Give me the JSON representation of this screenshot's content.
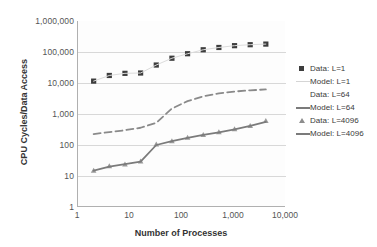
{
  "chart_data": {
    "type": "scatter",
    "title": "",
    "xlabel": "Number of Processes",
    "ylabel": "CPU Cycles/Data Access",
    "xscale": "log",
    "yscale": "log",
    "xlim": [
      1,
      10000
    ],
    "ylim": [
      1,
      1000000
    ],
    "xticks": [
      "1",
      "10",
      "100",
      "1,000",
      "10,000"
    ],
    "xtick_values": [
      1,
      10,
      100,
      1000,
      10000
    ],
    "yticks": [
      "1",
      "10",
      "100",
      "1,000",
      "10,000",
      "100,000",
      "1,000,000"
    ],
    "ytick_values": [
      1,
      10,
      100,
      1000,
      10000,
      100000,
      1000000
    ],
    "grid": true,
    "grid_axis": "y",
    "legend_position": "right",
    "series": [
      {
        "name": "Data: L=1",
        "kind": "markers",
        "marker": "square",
        "color": "#3d3d3d",
        "x": [
          2,
          4,
          8,
          16,
          32,
          64,
          128,
          256,
          512,
          1024,
          2048,
          4096
        ],
        "y": [
          11500,
          17500,
          20500,
          21000,
          38000,
          63000,
          88000,
          118000,
          140000,
          160000,
          172000,
          180000
        ]
      },
      {
        "name": "Model: L=1",
        "kind": "line",
        "style": "solid-faint",
        "color": "#dcdcdc",
        "x": [
          2,
          4,
          8,
          16,
          32,
          64,
          128,
          256,
          512,
          1024,
          2048,
          4096
        ],
        "y": [
          11500,
          17500,
          20500,
          21000,
          38000,
          63000,
          88000,
          118000,
          140000,
          160000,
          172000,
          180000
        ]
      },
      {
        "name": "Data: L=64",
        "kind": "markers",
        "marker": "none",
        "color": "#ffffff",
        "x": [
          2,
          4,
          8,
          16,
          32,
          64,
          128,
          256,
          512,
          1024,
          2048,
          4096
        ],
        "y": [
          225,
          260,
          300,
          360,
          520,
          1500,
          2600,
          3700,
          4600,
          5300,
          5800,
          6200
        ]
      },
      {
        "name": "Model: L=64",
        "kind": "line",
        "style": "dashed",
        "color": "#8a8a8a",
        "x": [
          2,
          4,
          8,
          16,
          32,
          64,
          128,
          256,
          512,
          1024,
          2048,
          4096
        ],
        "y": [
          225,
          260,
          300,
          360,
          520,
          1500,
          2600,
          3700,
          4600,
          5300,
          5800,
          6200
        ]
      },
      {
        "name": "Data: L=4096",
        "kind": "markers",
        "marker": "triangle",
        "color": "#9a9a9a",
        "x": [
          2,
          4,
          8,
          16,
          32,
          64,
          128,
          256,
          512,
          1024,
          2048,
          4096
        ],
        "y": [
          15,
          21,
          24,
          30,
          105,
          135,
          175,
          215,
          260,
          330,
          420,
          600
        ]
      },
      {
        "name": "Model: L=4096",
        "kind": "line",
        "style": "solid",
        "color": "#7b7b7b",
        "x": [
          2,
          4,
          8,
          16,
          32,
          64,
          128,
          256,
          512,
          1024,
          2048,
          4096
        ],
        "y": [
          15,
          20,
          24,
          29,
          100,
          133,
          170,
          212,
          255,
          320,
          415,
          560
        ]
      }
    ]
  },
  "axes": {
    "x_title": "Number of Processes",
    "y_title": "CPU Cycles/Data Access"
  },
  "legend": {
    "items": [
      {
        "label": "Data: L=1",
        "key": "square"
      },
      {
        "label": "Model: L=1",
        "key": "line-faint"
      },
      {
        "label": "Data: L=64",
        "key": "none"
      },
      {
        "label": "Model: L=64",
        "key": "line"
      },
      {
        "label": "Data: L=4096",
        "key": "triangle"
      },
      {
        "label": "Model: L=4096",
        "key": "line"
      }
    ]
  },
  "top_band": {
    "text": ""
  }
}
